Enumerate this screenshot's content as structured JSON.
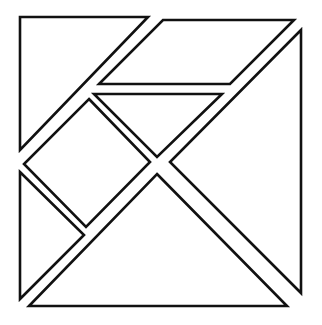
{
  "diagram": {
    "type": "tangram",
    "width": 322,
    "height": 325,
    "stroke_color": "#111111",
    "fill_color": "#ffffff",
    "background": "#ffffff",
    "pieces": [
      {
        "id": "large-triangle-top-left",
        "shape": "triangle",
        "points": "20,17 148,17 20,150"
      },
      {
        "id": "parallelogram-top",
        "shape": "parallelogram",
        "points": "163,20 294,20 230,84 99,84"
      },
      {
        "id": "large-triangle-right",
        "shape": "triangle",
        "points": "301,30 301,293 170,162"
      },
      {
        "id": "medium-triangle-center",
        "shape": "triangle",
        "points": "94,94 222,94 157,157"
      },
      {
        "id": "square-left",
        "shape": "square",
        "points": "89,99 150,162 86,227 24,164"
      },
      {
        "id": "small-triangle-bottom-left",
        "shape": "triangle",
        "points": "20,172 84,235 20,299"
      },
      {
        "id": "large-triangle-bottom",
        "shape": "triangle",
        "points": "157,174 287,306 29,306"
      }
    ]
  }
}
